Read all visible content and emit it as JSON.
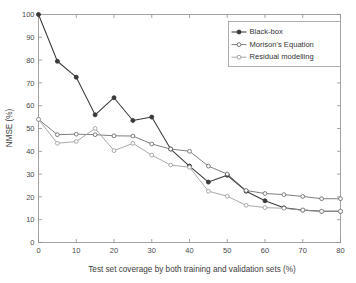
{
  "chart_data": {
    "type": "line",
    "title": "",
    "xlabel": "Test set coverage by both training and validation sets (%)",
    "ylabel": "NMSE (%)",
    "xlim": [
      0,
      80
    ],
    "ylim": [
      0,
      100
    ],
    "xticks": [
      0,
      10,
      20,
      30,
      40,
      50,
      60,
      70,
      80
    ],
    "yticks": [
      0,
      10,
      20,
      30,
      40,
      50,
      60,
      70,
      80,
      90,
      100
    ],
    "xticklabels": [
      "0",
      "10",
      "20",
      "30",
      "40",
      "50",
      "60",
      "70",
      "80"
    ],
    "yticklabels": [
      "0",
      "10",
      "20",
      "30",
      "40",
      "50",
      "60",
      "70",
      "80",
      "90",
      "100"
    ],
    "grid": false,
    "legend_position": "upper right",
    "x": [
      0,
      5,
      10,
      15,
      20,
      25,
      30,
      35,
      40,
      45,
      50,
      55,
      60,
      65,
      70,
      75,
      80
    ],
    "series": [
      {
        "name": "Black-box",
        "color": "#3a3a3a",
        "marker": "circle-filled",
        "values": [
          100.0,
          79.5,
          72.5,
          56.0,
          63.5,
          53.5,
          55.0,
          41.0,
          33.5,
          26.5,
          29.5,
          22.5,
          18.3,
          15.2,
          14.2,
          13.7,
          13.7
        ]
      },
      {
        "name": "Morison's Equation",
        "color": "#686868",
        "marker": "circle-open",
        "values": [
          54.0,
          47.3,
          47.5,
          47.3,
          46.8,
          46.7,
          43.2,
          41.0,
          40.0,
          33.5,
          30.0,
          22.8,
          21.5,
          21.0,
          20.2,
          19.2,
          19.2
        ]
      },
      {
        "name": "Residual modelling",
        "color": "#999999",
        "marker": "circle-open",
        "values": [
          54.0,
          43.5,
          44.3,
          50.0,
          40.3,
          43.5,
          38.3,
          34.0,
          33.0,
          22.5,
          20.3,
          16.3,
          15.3,
          15.0,
          14.2,
          13.7,
          13.7
        ]
      }
    ]
  },
  "legend": {
    "entries": [
      {
        "label": "Black-box"
      },
      {
        "label": "Morison's Equation"
      },
      {
        "label": "Residual modelling"
      }
    ]
  },
  "axes": {
    "x_title": "Test set coverage by both training and validation sets (%)",
    "y_title": "NMSE (%)"
  }
}
